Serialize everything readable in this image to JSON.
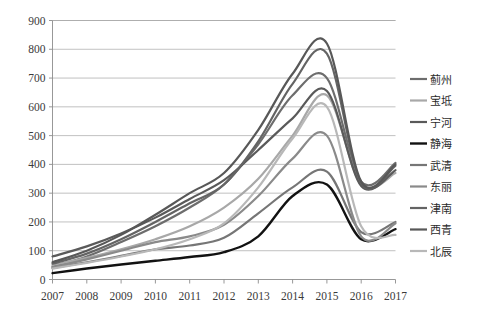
{
  "chart_data": {
    "type": "line",
    "title": "",
    "subtitle": "",
    "xlabel": "",
    "ylabel": "",
    "x": [
      2007,
      2008,
      2009,
      2010,
      2011,
      2012,
      2013,
      2014,
      2015,
      2016,
      2017
    ],
    "xlim": [
      2007,
      2017
    ],
    "ylim": [
      0,
      900
    ],
    "y_ticks": [
      0,
      100,
      200,
      300,
      400,
      500,
      600,
      700,
      800,
      900
    ],
    "x_ticks": [
      "2007",
      "2008",
      "2009",
      "2010",
      "2011",
      "2012",
      "2013",
      "2014",
      "2015",
      "2016",
      "2017"
    ],
    "grid": true,
    "legend_position": "right",
    "series": [
      {
        "name": "蓟州",
        "color": "#6d6d6d",
        "width": 2.2,
        "values": [
          45,
          80,
          130,
          185,
          250,
          330,
          470,
          640,
          700,
          340,
          405
        ]
      },
      {
        "name": "宝坻",
        "color": "#a8a8a8",
        "width": 2.2,
        "values": [
          50,
          75,
          105,
          140,
          185,
          250,
          350,
          500,
          640,
          330,
          370
        ]
      },
      {
        "name": "宁河",
        "color": "#5a5a5a",
        "width": 2.2,
        "values": [
          80,
          115,
          160,
          215,
          280,
          345,
          450,
          560,
          655,
          325,
          380
        ]
      },
      {
        "name": "静海",
        "color": "#121212",
        "width": 2.4,
        "values": [
          22,
          38,
          52,
          65,
          78,
          95,
          150,
          290,
          330,
          140,
          175
        ]
      },
      {
        "name": "武清",
        "color": "#767676",
        "width": 2.2,
        "values": [
          40,
          60,
          82,
          105,
          118,
          145,
          230,
          320,
          375,
          165,
          200
        ]
      },
      {
        "name": "东丽",
        "color": "#8a8a8a",
        "width": 2.2,
        "values": [
          42,
          70,
          100,
          130,
          150,
          190,
          290,
          420,
          500,
          150,
          195
        ]
      },
      {
        "name": "津南",
        "color": "#646464",
        "width": 2.2,
        "values": [
          55,
          90,
          140,
          200,
          265,
          330,
          480,
          680,
          785,
          335,
          395
        ]
      },
      {
        "name": "西青",
        "color": "#585858",
        "width": 2.2,
        "values": [
          60,
          100,
          155,
          225,
          300,
          370,
          520,
          715,
          820,
          340,
          400
        ]
      },
      {
        "name": "北辰",
        "color": "#b8b8b8",
        "width": 2.2,
        "values": [
          38,
          58,
          80,
          105,
          140,
          195,
          320,
          490,
          600,
          185,
          155
        ]
      }
    ]
  },
  "legend": {
    "items": [
      {
        "label": "蓟州",
        "color": "#6d6d6d"
      },
      {
        "label": "宝坻",
        "color": "#a8a8a8"
      },
      {
        "label": "宁河",
        "color": "#5a5a5a"
      },
      {
        "label": "静海",
        "color": "#121212"
      },
      {
        "label": "武清",
        "color": "#767676"
      },
      {
        "label": "东丽",
        "color": "#8a8a8a"
      },
      {
        "label": "津南",
        "color": "#646464"
      },
      {
        "label": "西青",
        "color": "#585858"
      },
      {
        "label": "北辰",
        "color": "#b8b8b8"
      }
    ]
  }
}
